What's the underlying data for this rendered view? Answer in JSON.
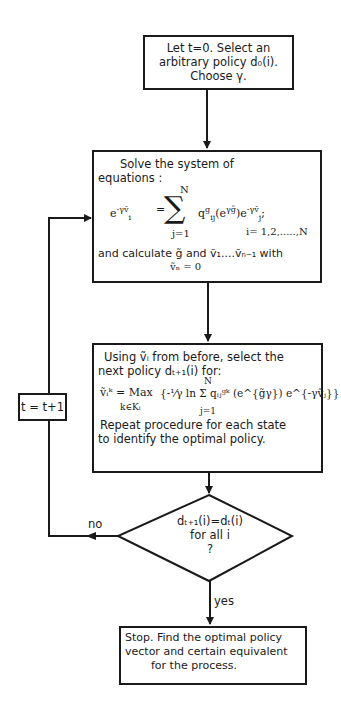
{
  "flowchart": {
    "start": {
      "lines": [
        "Let t=0.  Select an",
        "arbitrary policy d₀(i).",
        "Choose γ."
      ]
    },
    "solve": {
      "intro": [
        "Solve  the  system  of",
        "equations :"
      ],
      "equation": "e^{-γṽ_i} = Σ_{j=1}^{N} q_ij^g (e^{γg̃}) e^{-γṽ_j};",
      "eq_lhs": "e",
      "eq_lhs_exp": "-γṽ",
      "eq_lhs_sub": "i",
      "eq_sum_top": "N",
      "eq_sum_bottom": "j=1",
      "eq_rhs": "q",
      "eq_rhs_sup": "g",
      "eq_rhs_sub": "ij",
      "eq_rhs_rest": "(e",
      "eq_rhs_rest_exp": "γg̃",
      "eq_rhs_rest2": ")e",
      "eq_rhs_rest2_exp": "-γṽ",
      "eq_rhs_rest2_sub": "j",
      "eq_range": "i= 1,2,.....,N",
      "tail": "and calculate g̃ and ṽ₁....ṽₙ₋₁ with",
      "condition": "ṽₙ = 0"
    },
    "improve": {
      "lines": [
        "Using ṽᵢ from  before, select the",
        "next policy dₜ₊₁(i) for:"
      ],
      "formula_left": "ṽᵢᵏ = Max",
      "formula_under": "k∈Kᵢ",
      "formula_body": "{-¹⁄γ ln Σ qᵢⱼᵍᵏ (e^{g̃γ}) e^{-γṽⱼ}}",
      "sum_top": "N",
      "sum_bottom": "j=1",
      "repeat": [
        "Repeat  procedure  for  each  state",
        "to  identify  the  optimal  policy."
      ]
    },
    "decision": {
      "lines": [
        "dₜ₊₁(i)=dₜ(i)",
        "for  all  i",
        "?"
      ],
      "no_label": "no",
      "yes_label": "yes"
    },
    "increment": {
      "label": "t = t+1"
    },
    "stop": {
      "lines": [
        "Stop. Find  the  optimal  policy",
        "vector  and  certain  equivalent",
        "for  the  process."
      ]
    }
  }
}
